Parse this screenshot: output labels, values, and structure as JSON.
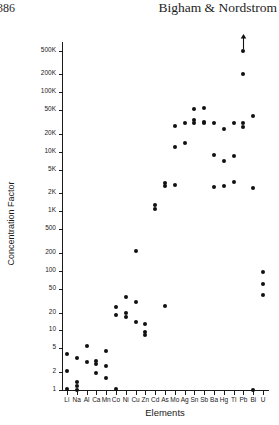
{
  "header": {
    "page_number": "386",
    "running_title": "Bigham & Nordstrom"
  },
  "chart_data": {
    "type": "scatter",
    "title": "",
    "xlabel": "Elements",
    "ylabel": "Concentration Factor",
    "grid": false,
    "legend": "none",
    "yscale": "log",
    "ylim": [
      1,
      700000
    ],
    "ytick_labels": [
      "500K",
      "200K",
      "100K",
      "50K",
      "20K",
      "10K",
      "5K",
      "2K",
      "1K",
      "500",
      "200",
      "100",
      "50",
      "20",
      "10",
      "5",
      "2",
      "1"
    ],
    "ytick_values": [
      500000,
      200000,
      100000,
      50000,
      20000,
      10000,
      5000,
      2000,
      1000,
      500,
      200,
      100,
      50,
      20,
      10,
      5,
      2,
      1
    ],
    "categories": [
      "Li",
      "Na",
      "Al",
      "Ca",
      "Mn",
      "Co",
      "Ni",
      "Cu",
      "Zn",
      "Cd",
      "As",
      "Mo",
      "Ag",
      "Sn",
      "Sb",
      "Ba",
      "Hg",
      "Tl",
      "Pb",
      "Bi",
      "U"
    ],
    "annotations": [
      {
        "text": "up-arrow",
        "category": "Pb",
        "meaning": "value off scale above 500K"
      }
    ],
    "series": [
      {
        "name": "Concentration factor",
        "points": [
          {
            "x": "Li",
            "y": 4.0
          },
          {
            "x": "Li",
            "y": 2.1
          },
          {
            "x": "Li",
            "y": 1.05
          },
          {
            "x": "Na",
            "y": 3.4
          },
          {
            "x": "Na",
            "y": 1.35
          },
          {
            "x": "Na",
            "y": 1.15
          },
          {
            "x": "Na",
            "y": 1.0
          },
          {
            "x": "Al",
            "y": 5.4
          },
          {
            "x": "Al",
            "y": 3.0
          },
          {
            "x": "Ca",
            "y": 3.1
          },
          {
            "x": "Ca",
            "y": 2.7
          },
          {
            "x": "Ca",
            "y": 1.9
          },
          {
            "x": "Mn",
            "y": 4.6
          },
          {
            "x": "Mn",
            "y": 2.5
          },
          {
            "x": "Mn",
            "y": 1.6
          },
          {
            "x": "Co",
            "y": 25
          },
          {
            "x": "Co",
            "y": 18
          },
          {
            "x": "Co",
            "y": 1.05
          },
          {
            "x": "Ni",
            "y": 36
          },
          {
            "x": "Ni",
            "y": 20
          },
          {
            "x": "Ni",
            "y": 17
          },
          {
            "x": "Cu",
            "y": 220
          },
          {
            "x": "Cu",
            "y": 30
          },
          {
            "x": "Cu",
            "y": 14
          },
          {
            "x": "Zn",
            "y": 13
          },
          {
            "x": "Zn",
            "y": 9.5
          },
          {
            "x": "Zn",
            "y": 8.5
          },
          {
            "x": "Cd",
            "y": 1300
          },
          {
            "x": "Cd",
            "y": 1100
          },
          {
            "x": "As",
            "y": 3000
          },
          {
            "x": "As",
            "y": 2700
          },
          {
            "x": "As",
            "y": 26
          },
          {
            "x": "Mo",
            "y": 27000
          },
          {
            "x": "Mo",
            "y": 12000
          },
          {
            "x": "Mo",
            "y": 2800
          },
          {
            "x": "Ag",
            "y": 30000
          },
          {
            "x": "Ag",
            "y": 14000
          },
          {
            "x": "Sn",
            "y": 52000
          },
          {
            "x": "Sn",
            "y": 34000
          },
          {
            "x": "Sn",
            "y": 30000
          },
          {
            "x": "Sb",
            "y": 55000
          },
          {
            "x": "Sb",
            "y": 32000
          },
          {
            "x": "Sb",
            "y": 30000
          },
          {
            "x": "Ba",
            "y": 30000
          },
          {
            "x": "Ba",
            "y": 9000
          },
          {
            "x": "Ba",
            "y": 2600
          },
          {
            "x": "Hg",
            "y": 24000
          },
          {
            "x": "Hg",
            "y": 7000
          },
          {
            "x": "Hg",
            "y": 2700
          },
          {
            "x": "Tl",
            "y": 30000
          },
          {
            "x": "Tl",
            "y": 8500
          },
          {
            "x": "Tl",
            "y": 3100
          },
          {
            "x": "Pb",
            "y": 500000
          },
          {
            "x": "Pb",
            "y": 200000
          },
          {
            "x": "Pb",
            "y": 30000
          },
          {
            "x": "Pb",
            "y": 26000
          },
          {
            "x": "Bi",
            "y": 40000
          },
          {
            "x": "Bi",
            "y": 2500
          },
          {
            "x": "Bi",
            "y": 1.0
          },
          {
            "x": "U",
            "y": 95
          },
          {
            "x": "U",
            "y": 60
          },
          {
            "x": "U",
            "y": 40
          }
        ]
      }
    ]
  }
}
